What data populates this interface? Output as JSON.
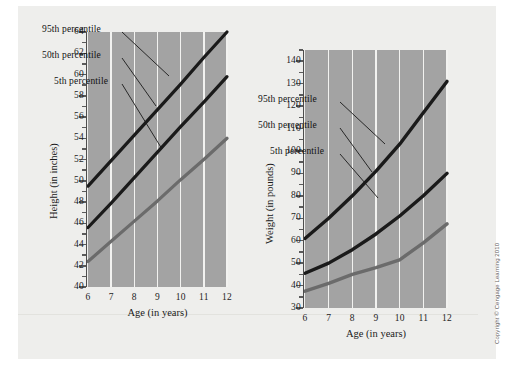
{
  "figure": {
    "copyright": "Copyright © Cengage Learning 2010",
    "background_color": "#eeeeec",
    "plot_background_color": "#a3a3a3",
    "gridline_color": "#f2f2f0"
  },
  "chart_data": [
    {
      "id": "height",
      "type": "line",
      "title": "",
      "xlabel": "Age (in years)",
      "ylabel": "Height (in inches)",
      "x": [
        6,
        7,
        8,
        9,
        10,
        11,
        12
      ],
      "xtick_labels": [
        "6",
        "7",
        "8",
        "9",
        "10",
        "11",
        "12"
      ],
      "xlim": [
        6,
        12
      ],
      "ylim": [
        40,
        64
      ],
      "ytick_labels": [
        "40",
        "42",
        "44",
        "46",
        "48",
        "50",
        "52",
        "54",
        "56",
        "58",
        "60",
        "62",
        "64"
      ],
      "ytick_values": [
        40,
        42,
        44,
        46,
        48,
        50,
        52,
        54,
        56,
        58,
        60,
        62,
        64
      ],
      "ytick_minor_step": 1,
      "grid": "vertical",
      "legend_position": "inside-upper-left",
      "series": [
        {
          "name": "95th percentile",
          "color": "#1a1a1a",
          "width": 3.2,
          "values": [
            49.5,
            51.9,
            54.3,
            56.7,
            59.1,
            61.6,
            64.0
          ]
        },
        {
          "name": "50th percentile",
          "color": "#1a1a1a",
          "width": 3.2,
          "values": [
            45.6,
            47.9,
            50.3,
            52.7,
            55.1,
            57.4,
            59.8
          ]
        },
        {
          "name": "5th percentile",
          "color": "#6b6b6b",
          "width": 3.2,
          "values": [
            42.4,
            44.3,
            46.2,
            48.1,
            50.1,
            52.0,
            54.0
          ]
        }
      ]
    },
    {
      "id": "weight",
      "type": "line",
      "title": "",
      "xlabel": "Age (in years)",
      "ylabel": "Weight (in pounds)",
      "x": [
        6,
        7,
        8,
        9,
        10,
        11,
        12
      ],
      "xtick_labels": [
        "6",
        "7",
        "8",
        "9",
        "10",
        "11",
        "12"
      ],
      "xlim": [
        6,
        12
      ],
      "ylim": [
        30,
        145
      ],
      "ytick_labels": [
        "30",
        "40",
        "50",
        "60",
        "70",
        "80",
        "90",
        "100",
        "110",
        "120",
        "130",
        "140"
      ],
      "ytick_values": [
        30,
        40,
        50,
        60,
        70,
        80,
        90,
        100,
        110,
        120,
        130,
        140
      ],
      "ytick_minor_step": 5,
      "grid": "vertical",
      "legend_position": "inside-upper-left",
      "series": [
        {
          "name": "95th percentile",
          "color": "#1a1a1a",
          "width": 3.4,
          "values": [
            61,
            70,
            80,
            91,
            103,
            117,
            131
          ]
        },
        {
          "name": "50th percentile",
          "color": "#1a1a1a",
          "width": 3.4,
          "values": [
            45.5,
            50,
            56,
            63,
            71,
            80,
            90
          ]
        },
        {
          "name": "5th percentile",
          "color": "#6b6b6b",
          "width": 3.4,
          "values": [
            37.5,
            41,
            45,
            48,
            51.5,
            59,
            67.5
          ]
        }
      ]
    }
  ]
}
